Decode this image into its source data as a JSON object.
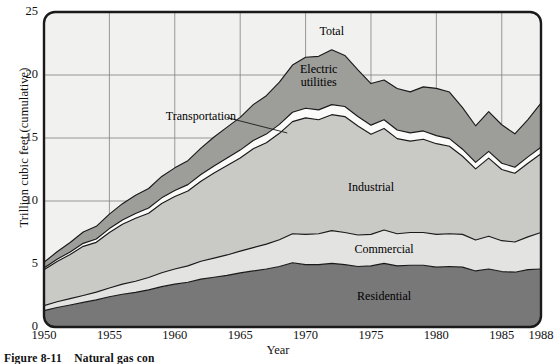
{
  "figure": {
    "caption_number": "Figure 8-11",
    "caption_text": "Natural gas con"
  },
  "chart_data": {
    "type": "area",
    "stacked": true,
    "title": "",
    "xlabel": "Year",
    "ylabel": "Trillion cubic feet (cumulative)",
    "xlim": [
      1950,
      1988
    ],
    "ylim": [
      0,
      25
    ],
    "yticks": [
      0,
      5,
      10,
      15,
      20,
      25
    ],
    "xticks": [
      1950,
      1955,
      1960,
      1965,
      1970,
      1975,
      1980,
      1985,
      1988
    ],
    "grid": true,
    "legend_position": "in-plot-annotations",
    "annotations": [
      {
        "label": "Total",
        "x": 1972,
        "y": 23.4
      },
      {
        "label": "Electric\nutilities",
        "x": 1971,
        "y": 20.4
      },
      {
        "label": "Transportation",
        "x": 1962,
        "y": 16.7,
        "leader_to": {
          "x": 1968.6,
          "y": 15.4
        }
      },
      {
        "label": "Industrial",
        "x": 1975,
        "y": 11.0
      },
      {
        "label": "Commercial",
        "x": 1976,
        "y": 6.1
      },
      {
        "label": "Residential",
        "x": 1976,
        "y": 2.4
      }
    ],
    "colors": {
      "Residential": "#787878",
      "Commercial": "#e3e3e1",
      "Industrial": "#c9c9c6",
      "Transportation": "#fbfbfa",
      "Electric utilities": "#9d9d9a",
      "plot_background": "#ebebe8",
      "above_total_background": "#f1f1ef",
      "axis_line": "#1a1a1a",
      "grid_line": "#808080"
    },
    "x": [
      1950,
      1951,
      1952,
      1953,
      1954,
      1955,
      1956,
      1957,
      1958,
      1959,
      1960,
      1961,
      1962,
      1963,
      1964,
      1965,
      1966,
      1967,
      1968,
      1969,
      1970,
      1971,
      1972,
      1973,
      1974,
      1975,
      1976,
      1977,
      1978,
      1979,
      1980,
      1981,
      1982,
      1983,
      1984,
      1985,
      1986,
      1987,
      1988
    ],
    "series": [
      {
        "name": "Residential",
        "values": [
          1.3,
          1.55,
          1.75,
          1.95,
          2.15,
          2.4,
          2.6,
          2.75,
          2.95,
          3.2,
          3.4,
          3.55,
          3.8,
          3.95,
          4.1,
          4.3,
          4.45,
          4.6,
          4.8,
          5.1,
          4.95,
          4.95,
          5.05,
          4.95,
          4.8,
          4.85,
          5.05,
          4.85,
          4.9,
          4.9,
          4.75,
          4.8,
          4.75,
          4.45,
          4.6,
          4.4,
          4.35,
          4.55,
          4.6
        ]
      },
      {
        "name": "Commercial",
        "values": [
          0.4,
          0.45,
          0.5,
          0.55,
          0.62,
          0.7,
          0.8,
          0.88,
          0.98,
          1.1,
          1.2,
          1.3,
          1.42,
          1.52,
          1.62,
          1.72,
          1.85,
          1.98,
          2.12,
          2.3,
          2.4,
          2.45,
          2.6,
          2.55,
          2.5,
          2.5,
          2.65,
          2.55,
          2.6,
          2.6,
          2.6,
          2.6,
          2.6,
          2.45,
          2.6,
          2.45,
          2.4,
          2.6,
          2.9
        ]
      },
      {
        "name": "Industrial",
        "values": [
          2.85,
          3.2,
          3.5,
          3.9,
          3.95,
          4.4,
          4.75,
          5.0,
          5.1,
          5.5,
          5.75,
          5.95,
          6.35,
          6.75,
          7.1,
          7.4,
          7.85,
          8.05,
          8.45,
          8.9,
          9.25,
          9.05,
          9.2,
          9.2,
          8.65,
          7.95,
          8.05,
          7.55,
          7.25,
          7.4,
          7.2,
          6.95,
          6.2,
          5.65,
          6.2,
          5.65,
          5.45,
          5.85,
          6.25
        ]
      },
      {
        "name": "Transportation",
        "values": [
          0.13,
          0.17,
          0.21,
          0.24,
          0.27,
          0.31,
          0.34,
          0.38,
          0.41,
          0.45,
          0.48,
          0.5,
          0.53,
          0.56,
          0.59,
          0.62,
          0.65,
          0.68,
          0.71,
          0.74,
          0.76,
          0.78,
          0.8,
          0.8,
          0.76,
          0.72,
          0.7,
          0.68,
          0.66,
          0.66,
          0.64,
          0.6,
          0.56,
          0.52,
          0.54,
          0.5,
          0.48,
          0.5,
          0.52
        ]
      },
      {
        "name": "Electric utilities",
        "values": [
          0.45,
          0.6,
          0.75,
          0.9,
          1.0,
          1.15,
          1.3,
          1.45,
          1.55,
          1.7,
          1.8,
          1.9,
          2.1,
          2.3,
          2.45,
          2.6,
          2.85,
          3.05,
          3.35,
          3.75,
          4.05,
          4.25,
          4.35,
          4.05,
          3.7,
          3.3,
          3.15,
          3.3,
          3.25,
          3.5,
          3.75,
          3.7,
          3.3,
          2.9,
          3.15,
          3.05,
          2.65,
          2.95,
          3.5
        ]
      }
    ],
    "total": {
      "name": "Total",
      "values": [
        5.13,
        5.97,
        6.71,
        7.54,
        7.99,
        8.96,
        9.79,
        10.46,
        10.99,
        11.95,
        12.63,
        13.2,
        14.2,
        15.08,
        15.86,
        16.64,
        17.65,
        18.36,
        19.43,
        20.79,
        21.41,
        21.48,
        22.0,
        21.55,
        20.41,
        19.32,
        19.6,
        18.93,
        18.66,
        19.06,
        18.94,
        18.65,
        17.41,
        15.97,
        17.09,
        16.05,
        15.33,
        16.45,
        17.77
      ]
    }
  }
}
